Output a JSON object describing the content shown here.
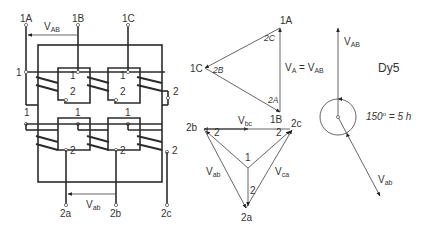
{
  "diagram": {
    "vector_group": "Dy5",
    "phase_shift_label": "150° = 5 h",
    "phase_shift_deg": "150",
    "phase_shift_suffix": " = 5 h",
    "colors": {
      "line": "#2b2b2b",
      "phasor": "#555555",
      "background": "#ffffff"
    },
    "wiring": {
      "hv_terminals": [
        "1A",
        "1B",
        "1C"
      ],
      "lv_terminals": [
        "2a",
        "2b",
        "2c"
      ],
      "hv_voltage": {
        "base": "V",
        "sub": "AB"
      },
      "lv_voltage": {
        "base": "V",
        "sub": "ab"
      },
      "winding_start": "1",
      "winding_end": "2"
    },
    "hv_triangle": {
      "vertices": [
        "1A",
        "1C",
        "1B"
      ],
      "inner_labels": [
        "2C",
        "2B",
        "2A"
      ],
      "equation": {
        "lhs_base": "V",
        "lhs_sub": "A",
        "eq": " = ",
        "rhs_base": "V",
        "rhs_sub": "AB"
      }
    },
    "lv_star": {
      "vertices": [
        "2b",
        "2c",
        "2a"
      ],
      "neutral_label": "1",
      "end_labels": [
        "2",
        "2",
        "2"
      ],
      "voltages": [
        {
          "base": "V",
          "sub": "bc"
        },
        {
          "base": "V",
          "sub": "ab"
        },
        {
          "base": "V",
          "sub": "ca"
        }
      ]
    },
    "clock_diagram": {
      "hv_phasor": {
        "base": "V",
        "sub": "AB"
      },
      "lv_phasor": {
        "base": "V",
        "sub": "ab"
      }
    }
  }
}
